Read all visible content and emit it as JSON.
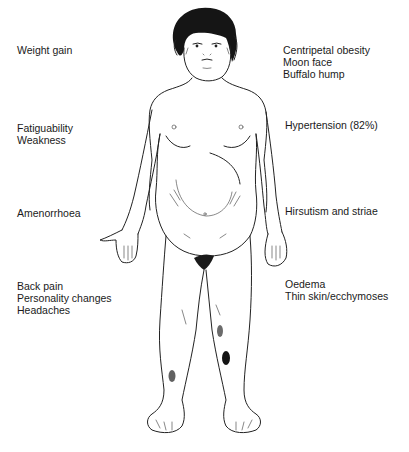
{
  "diagram": {
    "left_labels": [
      {
        "id": "weight",
        "lines": [
          "Weight gain"
        ]
      },
      {
        "id": "fatigue",
        "lines": [
          "Fatiguability",
          "Weakness"
        ]
      },
      {
        "id": "amen",
        "lines": [
          "Amenorrhoea"
        ]
      },
      {
        "id": "back",
        "lines": [
          "Back pain",
          "Personality changes",
          "Headaches"
        ]
      }
    ],
    "right_labels": [
      {
        "id": "obesity",
        "lines": [
          "Centripetal obesity",
          "Moon face",
          "Buffalo hump"
        ]
      },
      {
        "id": "htn",
        "lines": [
          "Hypertension (82%)"
        ]
      },
      {
        "id": "hirs",
        "lines": [
          "Hirsutism and striae"
        ]
      },
      {
        "id": "oed",
        "lines": [
          "Oedema",
          "Thin skin/ecchymoses"
        ]
      }
    ],
    "figure": {
      "description": "Front-view line drawing of a female figure with moon face, dark curly hair, truncal obesity, abdominal striae, and ecchymoses on the legs",
      "line_color": "#222222",
      "hair_color": "#111111"
    }
  }
}
